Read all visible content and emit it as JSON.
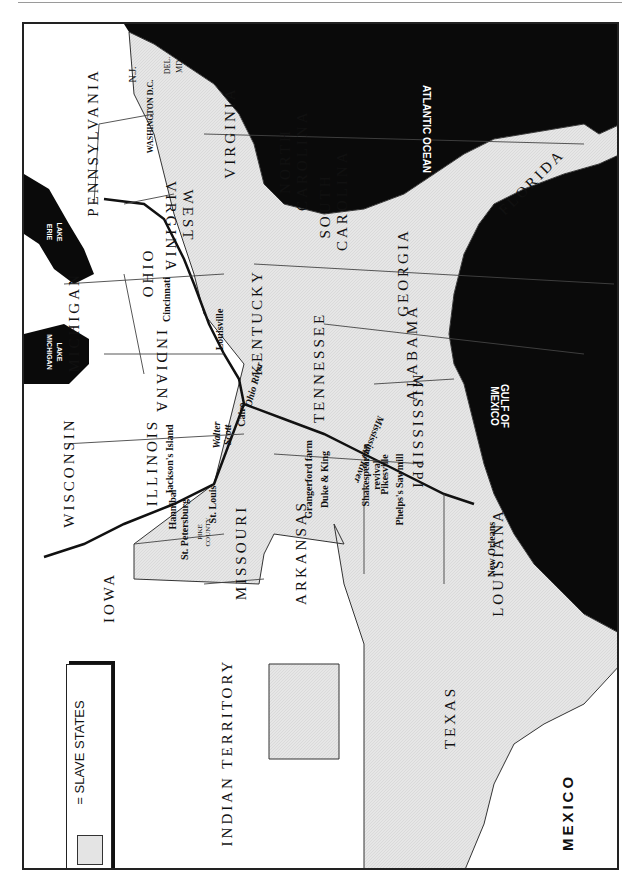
{
  "map": {
    "orientation": "rotated 90° clockwise",
    "colors": {
      "water": "#0a0a0a",
      "slave_state_fill": "#e4e4e4",
      "free_state_fill": "#ffffff",
      "border": "#333333"
    },
    "legend": {
      "label": "= SLAVE STATES"
    },
    "water_bodies": {
      "atlantic": "ATLANTIC OCEAN",
      "gulf": "GULF OF MEXICO",
      "lake_erie": "LAKE ERIE",
      "lake_michigan": "LAKE MICHIGAN"
    },
    "regions": {
      "pennsylvania": "PENNSYLVANIA",
      "nj": "N.J.",
      "del": "DEL.",
      "md": "MD.",
      "washington": "WASHINGTON D.C.",
      "virginia": "VIRGINIA",
      "west_virginia": "WEST VIRGINIA",
      "north_carolina": "NORTH CAROLINA",
      "south_carolina": "SOUTH CAROLINA",
      "georgia": "GEORGIA",
      "florida": "FLORIDA",
      "ohio": "OHIO",
      "michigan": "MICHIGAN",
      "indiana": "INDIANA",
      "kentucky": "KENTUCKY",
      "tennessee": "TENNESSEE",
      "alabama": "ALABAMA",
      "mississippi": "MISSISSIPPI",
      "wisconsin": "WISCONSIN",
      "illinois": "ILLINOIS",
      "missouri": "MISSOURI",
      "arkansas": "ARKANSAS",
      "louisiana": "LOUISIANA",
      "iowa": "IOWA",
      "indian_territory": "INDIAN TERRITORY",
      "texas": "TEXAS",
      "mexico": "MEXICO",
      "pike_county": "PIKE COUNTY"
    },
    "rivers": {
      "ohio": "Ohio River",
      "mississippi": "Mississippi River"
    },
    "places": {
      "cincinnati": "Cincinnati",
      "louisville": "Louisville",
      "cairo": "Cairo",
      "walter_scott": "Walter Scott",
      "jacksons_island": "Jackson's Island",
      "st_louis": "St. Louis",
      "hannibal": "Hannibal",
      "st_petersburg": "St. Petersburg",
      "grangerford": "Grangerford farm",
      "duke_king": "Duke & King",
      "shakespearian": "Shakespearian revival",
      "pikesville": "Pikesville",
      "phelps": "Phelps's Sawmill",
      "new_orleans": "New Orleans"
    }
  }
}
